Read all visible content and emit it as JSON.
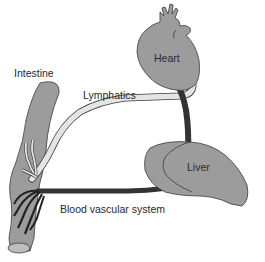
{
  "diagram": {
    "labels": {
      "intestine": "Intestine",
      "lymphatics": "Lymphatics",
      "heart": "Heart",
      "liver": "Liver",
      "blood_vascular_system": "Blood vascular system"
    },
    "colors": {
      "organ_fill": "#9a9a9a",
      "organ_stroke": "#3a3a3a",
      "lymphatic_fill": "#e4e4e4",
      "blood_vessel": "#333333",
      "background": "#ffffff"
    }
  }
}
